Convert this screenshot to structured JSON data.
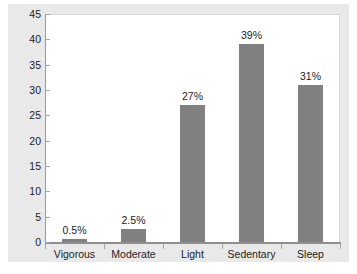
{
  "chart_data": {
    "type": "bar",
    "title": "",
    "subtitle": "",
    "xlabel": "",
    "ylabel": "",
    "categories": [
      "Vigorous",
      "Moderate",
      "Light",
      "Sedentary",
      "Sleep"
    ],
    "values": [
      0.5,
      2.5,
      27,
      39,
      31
    ],
    "data_labels": [
      "0.5%",
      "2.5%",
      "27%",
      "39%",
      "31%"
    ],
    "ylim": [
      0,
      45
    ],
    "y_ticks": [
      0,
      5,
      10,
      15,
      20,
      25,
      30,
      35,
      40,
      45
    ],
    "y_tick_labels": [
      "0",
      "5",
      "10",
      "15",
      "20",
      "25",
      "30",
      "35",
      "40",
      "45"
    ],
    "grid": false,
    "legend": null,
    "series": [
      {
        "name": "Percent of day",
        "values": [
          0.5,
          2.5,
          27,
          39,
          31
        ]
      }
    ],
    "colors": {
      "bar_fill": "#808080",
      "plot_background": "#ffffff",
      "figure_background": "#e9e9e9",
      "axis_line": "#8f8f8f",
      "text": "#1c1c1c"
    }
  }
}
